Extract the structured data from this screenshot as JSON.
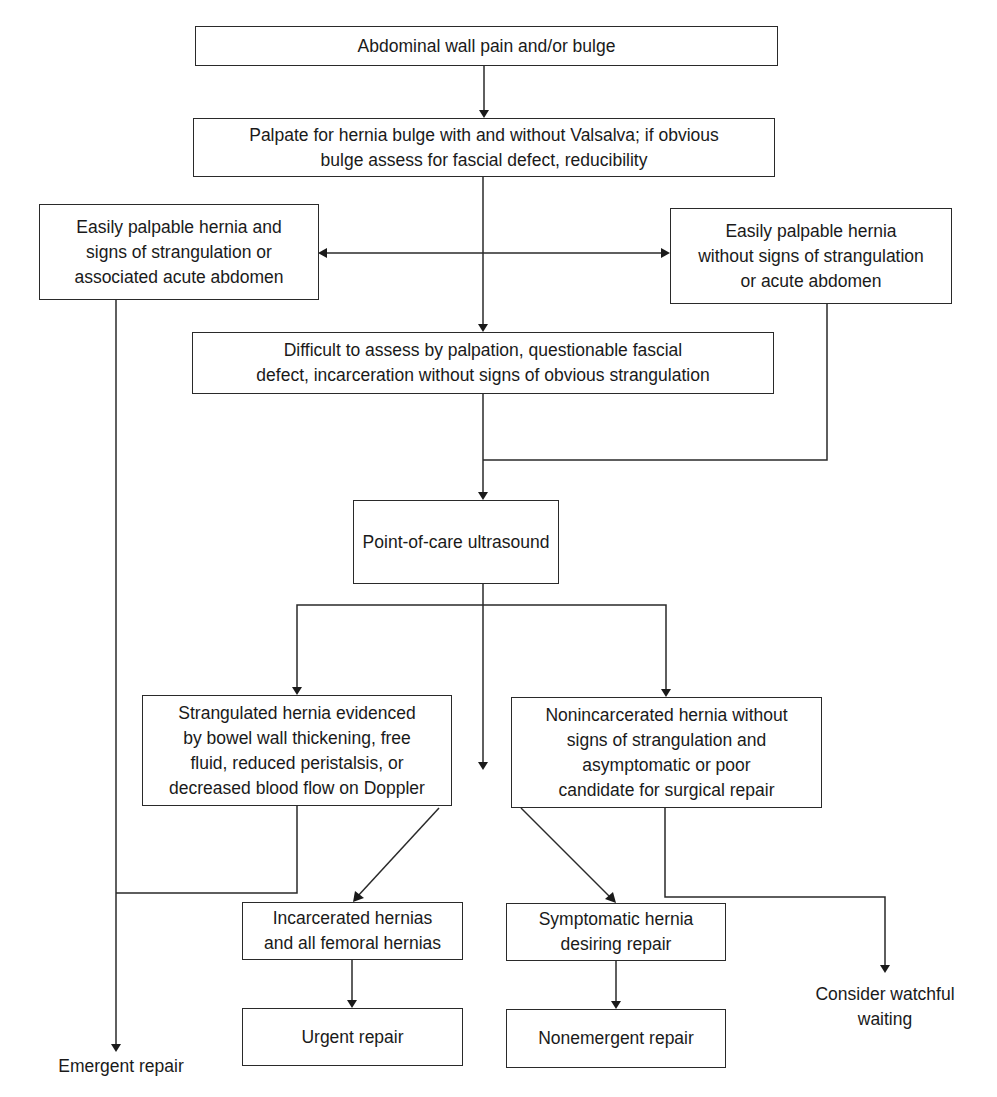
{
  "diagram": {
    "type": "flowchart",
    "topic": "Hernia evaluation algorithm",
    "nodes": {
      "start": {
        "text": "Abdominal wall pain and/or bulge"
      },
      "palpate": {
        "text": "Palpate for hernia bulge with and without Valsalva; if obvious\nbulge assess for fascial defect, reducibility"
      },
      "palpable_strangulation": {
        "text": "Easily palpable hernia and\nsigns of strangulation or\nassociated acute abdomen"
      },
      "palpable_no_strangulation": {
        "text": "Easily palpable hernia\nwithout signs of strangulation\nor acute abdomen"
      },
      "difficult": {
        "text": "Difficult to assess by palpation, questionable fascial\ndefect, incarceration without signs of obvious strangulation"
      },
      "pocus": {
        "text": "Point-of-care ultrasound"
      },
      "strangulated": {
        "text": "Strangulated hernia evidenced\nby bowel wall thickening, free\nfluid, reduced peristalsis, or\ndecreased blood flow on Doppler"
      },
      "nonincarcerated": {
        "text": "Nonincarcerated hernia without\nsigns of strangulation and\nasymptomatic or poor\ncandidate for surgical repair"
      },
      "incarcerated": {
        "text": "Incarcerated hernias\nand all femoral hernias"
      },
      "urgent": {
        "text": "Urgent repair"
      },
      "symptomatic": {
        "text": "Symptomatic hernia\ndesiring repair"
      },
      "nonemergent": {
        "text": "Nonemergent repair"
      }
    },
    "terminals": {
      "emergent": {
        "text": "Emergent repair"
      },
      "watchful": {
        "text": "Consider watchful\nwaiting"
      }
    },
    "edges": [
      {
        "from": "start",
        "to": "palpate"
      },
      {
        "from": "palpate",
        "to": "palpable_strangulation"
      },
      {
        "from": "palpate",
        "to": "palpable_no_strangulation"
      },
      {
        "from": "palpate",
        "to": "difficult"
      },
      {
        "from": "palpable_strangulation",
        "to": "emergent"
      },
      {
        "from": "difficult",
        "to": "pocus"
      },
      {
        "from": "palpable_no_strangulation",
        "to": "pocus"
      },
      {
        "from": "pocus",
        "to": "strangulated"
      },
      {
        "from": "pocus",
        "to": "nonincarcerated"
      },
      {
        "from": "pocus",
        "to": "(unlabeled)"
      },
      {
        "from": "strangulated",
        "to": "emergent"
      },
      {
        "from": "strangulated",
        "to": "incarcerated"
      },
      {
        "from": "incarcerated",
        "to": "urgent"
      },
      {
        "from": "nonincarcerated",
        "to": "symptomatic"
      },
      {
        "from": "nonincarcerated",
        "to": "watchful"
      },
      {
        "from": "symptomatic",
        "to": "nonemergent"
      }
    ]
  }
}
